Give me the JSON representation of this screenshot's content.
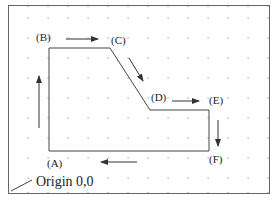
{
  "diagram": {
    "type": "toolpath",
    "colors": {
      "border": "#666666",
      "path": "#444444",
      "arrow": "#333333",
      "grid": "#999999",
      "text": "#222222"
    },
    "frame": {
      "x1": 8,
      "y1": 5,
      "x2": 269,
      "y2": 193
    },
    "grid": {
      "spacing": 20,
      "x0": 28,
      "y0": 5
    },
    "points": [
      {
        "id": "A",
        "label": "(A)",
        "x": 49,
        "y": 151,
        "lx": 47,
        "ly": 167
      },
      {
        "id": "B",
        "label": "(B)",
        "x": 49,
        "y": 48,
        "lx": 36,
        "ly": 41
      },
      {
        "id": "C",
        "label": "(C)",
        "x": 110,
        "y": 48,
        "lx": 111,
        "ly": 44
      },
      {
        "id": "D",
        "label": "(D)",
        "x": 150,
        "y": 110,
        "lx": 151,
        "ly": 101
      },
      {
        "id": "E",
        "label": "(E)",
        "x": 209,
        "y": 110,
        "lx": 209,
        "ly": 104
      },
      {
        "id": "F",
        "label": "(F)",
        "x": 209,
        "y": 151,
        "lx": 209,
        "ly": 163
      }
    ],
    "arrows": [
      {
        "name": "arrow-up-a-to-b",
        "x1": 39,
        "y1": 128,
        "x2": 39,
        "y2": 76
      },
      {
        "name": "arrow-right-b-to-c",
        "x1": 66,
        "y1": 39,
        "x2": 98,
        "y2": 39
      },
      {
        "name": "arrow-down-c-to-d",
        "x1": 129,
        "y1": 58,
        "x2": 143,
        "y2": 81
      },
      {
        "name": "arrow-right-d-to-e",
        "x1": 172,
        "y1": 101,
        "x2": 199,
        "y2": 101
      },
      {
        "name": "arrow-down-e-to-f",
        "x1": 218,
        "y1": 120,
        "x2": 218,
        "y2": 146
      },
      {
        "name": "arrow-left-f-to-a",
        "x1": 137,
        "y1": 162,
        "x2": 101,
        "y2": 162
      }
    ],
    "origin": {
      "label": "Origin 0,0",
      "lx": 36,
      "ly": 186,
      "leader": {
        "x1": 11,
        "y1": 191,
        "x2": 32,
        "y2": 180
      }
    }
  }
}
